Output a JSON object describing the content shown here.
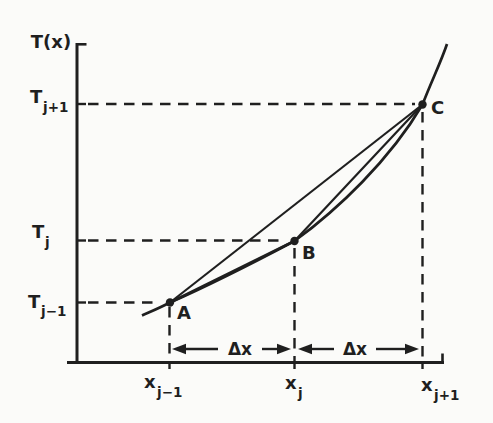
{
  "colors": {
    "ink": "#1f1f1f",
    "paper": "#fbfbf9"
  },
  "axes": {
    "y_title": "T(x)",
    "y_ticks": [
      {
        "base": "T",
        "sub": "j+1"
      },
      {
        "base": "T",
        "sub": "j"
      },
      {
        "base": "T",
        "sub": "j−1"
      }
    ],
    "x_ticks": [
      {
        "base": "x",
        "sub": "j−1"
      },
      {
        "base": "x",
        "sub": "j"
      },
      {
        "base": "x",
        "sub": "j+1"
      }
    ]
  },
  "points": [
    {
      "label": "A",
      "x_ref": "x_j-1",
      "y_ref": "T_j-1"
    },
    {
      "label": "B",
      "x_ref": "x_j",
      "y_ref": "T_j"
    },
    {
      "label": "C",
      "x_ref": "x_j+1",
      "y_ref": "T_j+1"
    }
  ],
  "intervals": [
    {
      "label": "Δx"
    },
    {
      "label": "Δx"
    }
  ]
}
